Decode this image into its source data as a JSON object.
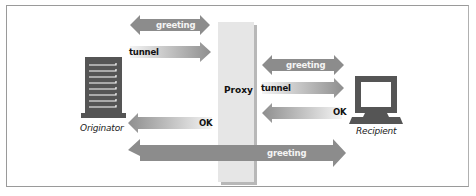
{
  "diagram": {
    "title": "",
    "nodes": {
      "originator": {
        "label": "Originator",
        "icon": "server-tower-icon"
      },
      "proxy": {
        "label": "Proxy"
      },
      "recipient": {
        "label": "Recipient",
        "icon": "monitor-icon"
      }
    },
    "arrows": {
      "left_greeting": {
        "label": "greeting",
        "direction": "both",
        "from": "Originator",
        "to": "Proxy"
      },
      "left_tunnel": {
        "label": "tunnel",
        "direction": "right",
        "from": "Originator",
        "to": "Proxy"
      },
      "right_greeting": {
        "label": "greeting",
        "direction": "both",
        "from": "Proxy",
        "to": "Recipient"
      },
      "right_tunnel": {
        "label": "tunnel",
        "direction": "right",
        "from": "Proxy",
        "to": "Recipient"
      },
      "right_ok": {
        "label": "OK",
        "direction": "left",
        "from": "Recipient",
        "to": "Proxy"
      },
      "left_ok": {
        "label": "OK",
        "direction": "left",
        "from": "Proxy",
        "to": "Originator"
      },
      "end_to_end_greeting": {
        "label": "greeting",
        "direction": "right",
        "from": "Originator",
        "to": "Recipient"
      }
    },
    "colors": {
      "arrow_solid": "#8c8c8c",
      "arrow_gradient_start": "#9a9a9a",
      "arrow_gradient_end": "#f2f2f2",
      "proxy_fill": "#e6e6e6",
      "proxy_shadow": "#b8b8b8",
      "icon_fill": "#555555",
      "frame_border": "#9a9a9a"
    }
  }
}
